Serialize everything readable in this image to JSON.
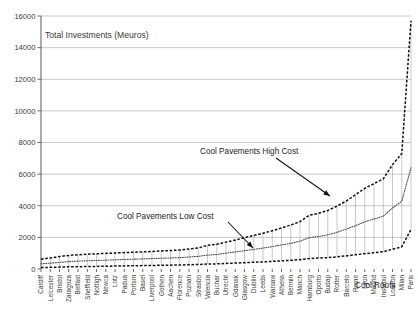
{
  "chart_data": {
    "type": "line",
    "title": "Total Investments (Meuros)",
    "xlabel": "",
    "ylabel": "",
    "ylim": [
      0,
      16000
    ],
    "yticks": [
      0,
      2000,
      4000,
      6000,
      8000,
      10000,
      12000,
      14000,
      16000
    ],
    "ytick_labels": [
      "0",
      "2000",
      "4000",
      "6000",
      "8000",
      "10000",
      "12000",
      "14000",
      "16000"
    ],
    "grid": true,
    "legend": "none",
    "categories": [
      "Cardiff",
      "Leicester",
      "Bristol",
      "Zaragoza",
      "Belfast",
      "Sheffield",
      "Nottigh",
      "Newca",
      "Lotz",
      "Padua",
      "Portsm",
      "Basel",
      "Liverpool",
      "Gothen",
      "Aachen",
      "Florence",
      "Poznan",
      "Strasbo",
      "Valencia",
      "Buchar",
      "Utrecht",
      "Gdansk",
      "Glasgow",
      "Dublin",
      "Leeds",
      "Warsaw",
      "Athens",
      "Bermin",
      "Manch",
      "Hamburg",
      "Oporto",
      "Budap",
      "Rotter",
      "Barcelo",
      "Rome",
      "Lyon",
      "Madrid",
      "Instabul",
      "London",
      "Milan",
      "Paris"
    ],
    "series": [
      {
        "name": "Cool Pavements High Cost",
        "style": "dashed",
        "values": [
          620,
          700,
          790,
          860,
          900,
          930,
          960,
          990,
          1010,
          1040,
          1060,
          1080,
          1110,
          1140,
          1170,
          1200,
          1260,
          1330,
          1500,
          1560,
          1700,
          1830,
          1980,
          2120,
          2260,
          2420,
          2600,
          2780,
          3000,
          3400,
          3520,
          3700,
          3980,
          4300,
          4700,
          5100,
          5400,
          5700,
          6600,
          7300,
          15700
        ]
      },
      {
        "name": "Cool Pavements Low Cost",
        "style": "dotted",
        "values": [
          330,
          370,
          420,
          470,
          500,
          520,
          540,
          560,
          580,
          600,
          620,
          640,
          660,
          680,
          700,
          720,
          760,
          800,
          880,
          920,
          1000,
          1080,
          1160,
          1240,
          1320,
          1420,
          1520,
          1620,
          1760,
          1980,
          2060,
          2160,
          2320,
          2520,
          2740,
          2980,
          3160,
          3340,
          3860,
          4280,
          6400
        ]
      },
      {
        "name": "Cool Roofs",
        "style": "dashed",
        "values": [
          90,
          105,
          120,
          135,
          145,
          155,
          165,
          175,
          185,
          195,
          205,
          215,
          225,
          235,
          245,
          255,
          270,
          285,
          310,
          325,
          350,
          375,
          400,
          425,
          450,
          480,
          515,
          550,
          590,
          660,
          690,
          720,
          770,
          830,
          900,
          970,
          1030,
          1090,
          1250,
          1400,
          2500
        ]
      }
    ],
    "annotations": [
      {
        "label": "Cool Pavements High Cost",
        "text_x": 200,
        "text_y": 154,
        "arrow_from_x": 276,
        "arrow_from_y": 158,
        "arrow_to_x": 330,
        "arrow_to_y": 196
      },
      {
        "label": "Cool Pavements Low Cost",
        "text_x": 117,
        "text_y": 219,
        "arrow_from_x": 228,
        "arrow_from_y": 222,
        "arrow_to_x": 253,
        "arrow_to_y": 248
      },
      {
        "label": "Cool Roofs",
        "text_x": 355,
        "text_y": 288,
        "arrow_from_x": null,
        "arrow_from_y": null,
        "arrow_to_x": null,
        "arrow_to_y": null
      }
    ]
  }
}
